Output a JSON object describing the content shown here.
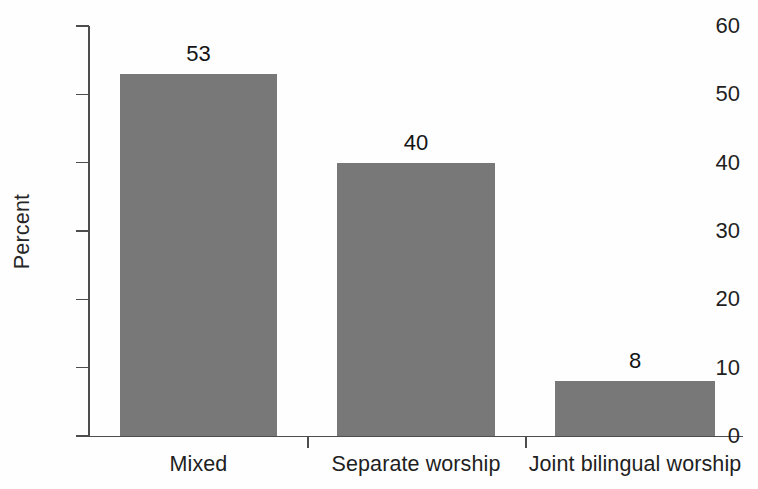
{
  "chart_data": {
    "type": "bar",
    "title": "",
    "subtitle": "",
    "xlabel": "",
    "ylabel": "Percent",
    "categories": [
      "Mixed",
      "Separate worship",
      "Joint bilingual worship"
    ],
    "values": [
      53,
      40,
      8
    ],
    "value_labels": [
      "53",
      "40",
      "8"
    ],
    "ylim": [
      0,
      60
    ],
    "ytick_values": [
      0,
      10,
      20,
      30,
      40,
      50,
      60
    ],
    "ytick_labels": [
      "0",
      "10",
      "20",
      "30",
      "40",
      "50",
      "60"
    ],
    "grid": false,
    "legend": null,
    "legend_position": "none",
    "bar_color": "#787878",
    "axis_color": "#4d4d4d",
    "text_color": "#1f1f1f",
    "annotations": []
  }
}
